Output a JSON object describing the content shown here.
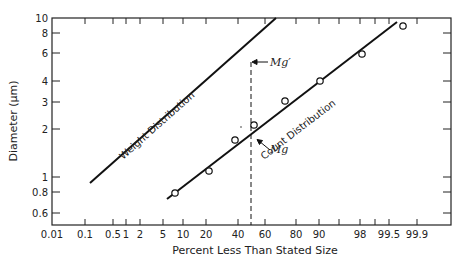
{
  "chart_data": {
    "type": "line",
    "title": "",
    "xlabel": "Percent Less Than Stated Size",
    "ylabel": "Diameter (μm)",
    "x_scale": "probability",
    "y_scale": "log",
    "xlim": [
      0.01,
      99.99
    ],
    "ylim": [
      0.5,
      10
    ],
    "grid": false,
    "x_ticks": [
      "0.01",
      "0.1",
      "0.5",
      "1",
      "2",
      "5",
      "10",
      "20",
      "40",
      "60",
      "80",
      "90",
      "98",
      "99.5",
      "99.9"
    ],
    "y_ticks": [
      "0.6",
      "0.8",
      "1",
      "2",
      "3",
      "4",
      "6",
      "8",
      "10"
    ],
    "series": [
      {
        "name": "Weight Distribution",
        "kind": "fitted-line",
        "x": [
          0.12,
          60
        ],
        "y": [
          0.92,
          10
        ]
      },
      {
        "name": "Count Distribution",
        "kind": "fitted-line",
        "x": [
          6,
          99.7
        ],
        "y": [
          0.76,
          9.5
        ]
      },
      {
        "name": "Count Distribution data",
        "kind": "scatter",
        "marker": "open-circle",
        "x": [
          8,
          22,
          38,
          52,
          73,
          90,
          98,
          99.7
        ],
        "y": [
          0.8,
          1.1,
          1.7,
          2.1,
          3.0,
          4.0,
          6.0,
          9.0
        ]
      }
    ],
    "annotations": [
      {
        "text": "Mg'",
        "x": 50,
        "y": 5.6,
        "note": "geometric mass median diameter, arrow to weight line"
      },
      {
        "text": "Mg",
        "x": 50,
        "y": 1.85,
        "note": "geometric count median diameter, arrow to count line"
      },
      {
        "text": "dashed vertical line",
        "x": 50
      }
    ]
  },
  "labels": {
    "xlabel": "Percent Less Than Stated Size",
    "ylabel": "Diameter (μm)",
    "weight_line": "Weight Distribution",
    "count_line": "Count Distribution",
    "mg_prime": "Mg′",
    "mg": "Mg"
  },
  "x_ticks": [
    {
      "label": "0.01",
      "px": 52
    },
    {
      "label": "0.1",
      "px": 85
    },
    {
      "label": "0.5",
      "px": 113
    },
    {
      "label": "1",
      "px": 126
    },
    {
      "label": "2",
      "px": 140
    },
    {
      "label": "5",
      "px": 163
    },
    {
      "label": "10",
      "px": 183
    },
    {
      "label": "20",
      "px": 206
    },
    {
      "label": "40",
      "px": 238
    },
    {
      "label": "60",
      "px": 265
    },
    {
      "label": "80",
      "px": 296
    },
    {
      "label": "90",
      "px": 319
    },
    {
      "label": "",
      "px": 339
    },
    {
      "label": "98",
      "px": 360
    },
    {
      "label": "",
      "px": 375
    },
    {
      "label": "99.5",
      "px": 389
    },
    {
      "label": "99.9",
      "px": 417
    }
  ],
  "y_ticks": [
    {
      "label": "10",
      "px": 18
    },
    {
      "label": "8",
      "px": 33
    },
    {
      "label": "6",
      "px": 53
    },
    {
      "label": "4",
      "px": 81
    },
    {
      "label": "3",
      "px": 102
    },
    {
      "label": "2",
      "px": 129
    },
    {
      "label": "1",
      "px": 177
    },
    {
      "label": "0.8",
      "px": 192
    },
    {
      "label": "0.6",
      "px": 213
    }
  ]
}
